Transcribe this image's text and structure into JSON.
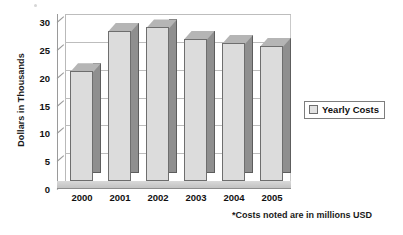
{
  "chart_data": {
    "type": "bar",
    "title": "",
    "subtitle": "",
    "xlabel": "",
    "ylabel": "Dollars in Thousands",
    "categories": [
      "2000",
      "2001",
      "2002",
      "2003",
      "2004",
      "2005"
    ],
    "values": [
      19.7,
      27.0,
      27.6,
      25.6,
      24.8,
      24.3
    ],
    "series": [
      {
        "name": "Yearly Costs",
        "values": [
          19.7,
          27.0,
          27.6,
          25.6,
          24.8,
          24.3
        ]
      }
    ],
    "ylim": [
      0,
      30
    ],
    "yticks": [
      0,
      5,
      10,
      15,
      20,
      25,
      30
    ],
    "ytick_labels": [
      "0",
      "5",
      "10",
      "15",
      "20",
      "25",
      "30"
    ],
    "grid": "horizontal",
    "legend": {
      "position": "right",
      "entries": [
        {
          "label": "Yearly Costs",
          "swatch_color": "#e2e2e2"
        }
      ]
    },
    "annotations": [
      {
        "text": "*Costs noted are in millions USD",
        "position": "bottom-right"
      }
    ],
    "style": {
      "three_d": true,
      "bar_front_color": "#dcdcdc",
      "bar_side_color": "#8f8f8f",
      "bar_top_color": "#b5b5b5",
      "bar_outline_color": "#6e6e6e",
      "gridline_color": "#bdbdbd",
      "axis_color": "#8d8d8d",
      "background": "#ffffff",
      "text_color": "#111111"
    }
  }
}
